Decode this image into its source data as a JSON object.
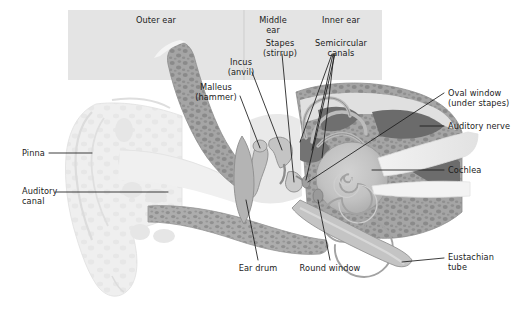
{
  "figure": {
    "background_color": "#ffffff",
    "panel_color": "#e3e3e3",
    "panel_divider_color": "#c9c9c9",
    "bone_color": "#9e9e9e",
    "bone_speckle_color": "#848484",
    "soft_tissue_color": "#cfcfcf",
    "pinna_color": "#ececec",
    "dark_tissue_color": "#6e6e6e",
    "cochlea_color": "#bdbdbd",
    "leader_line_color": "#1b1b1b",
    "text_color": "#1b1b1b"
  },
  "regions": [
    {
      "id": "outer",
      "label": "Outer ear",
      "x": 156,
      "y": 19
    },
    {
      "id": "middle",
      "label_line1": "Middle",
      "label_line2": "ear",
      "x": 272,
      "y": 19
    },
    {
      "id": "inner",
      "label": "Inner ear",
      "x": 341,
      "y": 19
    }
  ],
  "callouts": [
    {
      "id": "stapes",
      "line1": "Stapes",
      "line2": "(stirrup)",
      "align": "center",
      "x": 279,
      "y": 43
    },
    {
      "id": "semicircular-canals",
      "line1": "Semicircular",
      "line2": "canals",
      "align": "center",
      "x": 341,
      "y": 43
    },
    {
      "id": "incus",
      "line1": "Incus",
      "line2": "(anvil)",
      "align": "center",
      "x": 241,
      "y": 62
    },
    {
      "id": "malleus",
      "line1": "Malleus",
      "line2": "(hammer)",
      "align": "center",
      "x": 216,
      "y": 87
    },
    {
      "id": "oval-window",
      "line1": "Oval window",
      "line2": "(under stapes)",
      "align": "left",
      "x": 448,
      "y": 90
    },
    {
      "id": "auditory-nerve",
      "line1": "Auditory nerve",
      "align": "left",
      "x": 448,
      "y": 122
    },
    {
      "id": "cochlea",
      "line1": "Cochlea",
      "align": "left",
      "x": 448,
      "y": 166
    },
    {
      "id": "eustachian-tube",
      "line1": "Eustachian",
      "line2": "tube",
      "align": "left",
      "x": 448,
      "y": 253
    },
    {
      "id": "pinna",
      "line1": "Pinna",
      "align": "left",
      "x": 22,
      "y": 150
    },
    {
      "id": "auditory-canal",
      "line1": "Auditory",
      "line2": "canal",
      "align": "left",
      "x": 22,
      "y": 188
    },
    {
      "id": "ear-drum",
      "line1": "Ear drum",
      "align": "center",
      "x": 258,
      "y": 265
    },
    {
      "id": "round-window",
      "line1": "Round window",
      "align": "center",
      "x": 330,
      "y": 265
    }
  ]
}
